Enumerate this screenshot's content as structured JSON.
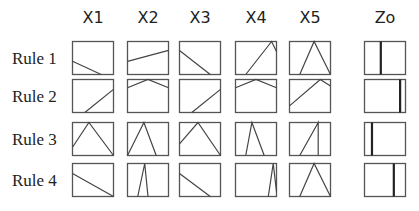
{
  "columns": [
    {
      "label": "X1",
      "x": 72
    },
    {
      "label": "X2",
      "x": 127
    },
    {
      "label": "X3",
      "x": 179
    },
    {
      "label": "X4",
      "x": 235
    },
    {
      "label": "X5",
      "x": 289
    },
    {
      "label": "Zo",
      "x": 364
    }
  ],
  "rows": [
    {
      "label": "Rule 1",
      "y": 41,
      "cells": [
        [
          [
            0,
            0.6
          ],
          [
            0.7,
            1
          ]
        ],
        [
          [
            0,
            0.6
          ],
          [
            1,
            0.27
          ]
        ],
        [
          [
            0,
            0.27
          ],
          [
            0.75,
            1
          ]
        ],
        [
          [
            0.25,
            1
          ],
          [
            0.88,
            0
          ],
          [
            1,
            0.3
          ]
        ],
        [
          [
            0.25,
            1
          ],
          [
            0.6,
            0
          ],
          [
            1,
            1
          ]
        ]
      ],
      "output": 0.4
    },
    {
      "label": "Rule 2",
      "y": 79,
      "cells": [
        [
          [
            0.3,
            1
          ],
          [
            1,
            0.3
          ]
        ],
        [
          [
            0,
            0.25
          ],
          [
            0.5,
            0
          ],
          [
            1,
            0.25
          ]
        ],
        [
          [
            0.3,
            1
          ],
          [
            1,
            0.3
          ]
        ],
        [
          [
            0,
            0.25
          ],
          [
            0.5,
            0
          ],
          [
            1,
            0.25
          ]
        ],
        [
          [
            0,
            0.8
          ],
          [
            0.75,
            0
          ],
          [
            1,
            0.2
          ]
        ]
      ],
      "output": 0.86
    },
    {
      "label": "Rule 3",
      "y": 122,
      "cells": [
        [
          [
            0,
            0.75
          ],
          [
            0.4,
            0
          ],
          [
            1,
            1
          ]
        ],
        [
          [
            0,
            1
          ],
          [
            0.4,
            0
          ],
          [
            0.7,
            1
          ]
        ],
        [
          [
            0,
            0.65
          ],
          [
            0.45,
            0
          ],
          [
            1,
            1
          ]
        ],
        [
          [
            0.25,
            1
          ],
          [
            0.4,
            0
          ],
          [
            0.7,
            1
          ]
        ],
        [
          [
            0.25,
            1
          ],
          [
            0.7,
            0
          ],
          [
            0.7,
            1
          ]
        ]
      ],
      "output": 0.19
    },
    {
      "label": "Rule 4",
      "y": 163,
      "cells": [
        [
          [
            0,
            0.3
          ],
          [
            1,
            1
          ]
        ],
        [
          [
            0.25,
            1
          ],
          [
            0.42,
            0
          ],
          [
            0.5,
            1
          ]
        ],
        [
          [
            0,
            0.3
          ],
          [
            0.75,
            1
          ]
        ],
        [
          [
            0.8,
            1
          ],
          [
            0.92,
            0
          ],
          [
            1,
            0.85
          ]
        ],
        [
          [
            0.25,
            1
          ],
          [
            0.6,
            0
          ],
          [
            1,
            1
          ]
        ]
      ],
      "output": 0.71
    }
  ],
  "cell_size": {
    "w": 42,
    "h": 34
  },
  "colors": {
    "frame": "#555555",
    "line": "#444444",
    "output_line": "#222222"
  }
}
